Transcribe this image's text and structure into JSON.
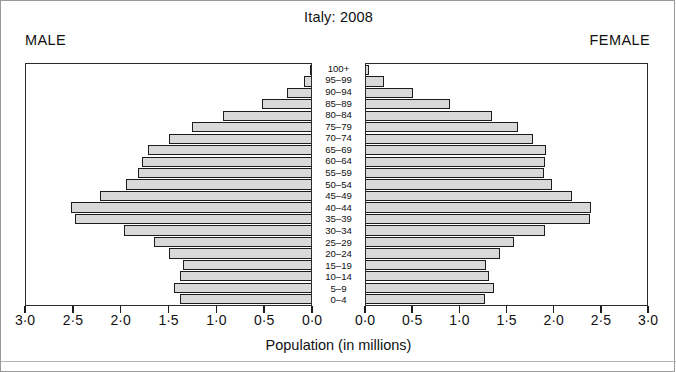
{
  "figure": {
    "title": "Italy:  2008",
    "male_label": "MALE",
    "female_label": "FEMALE",
    "xlabel": "Population (in millions)",
    "bar_fill": "#d9d9d9",
    "bar_stroke": "#1c1c1c",
    "frame_color": "#2b2b2b"
  },
  "axis": {
    "left_ticklabels": [
      "3·0",
      "2·5",
      "2·0",
      "1·5",
      "1·0",
      "0·5",
      "0·0"
    ],
    "right_ticklabels": [
      "0·0",
      "0·5",
      "1·0",
      "1·5",
      "2·0",
      "2·5",
      "3·0"
    ],
    "tick_values": [
      0.0,
      0.5,
      1.0,
      1.5,
      2.0,
      2.5,
      3.0
    ],
    "max": 3.0
  },
  "chart_data": {
    "type": "bar",
    "title": "Italy:  2008",
    "subtitle": "",
    "xlabel": "Population (in millions)",
    "ylabel": "",
    "xlim": [
      0,
      3.0
    ],
    "grid": false,
    "legend": [
      "MALE",
      "FEMALE"
    ],
    "legend_position": "top-left and top-right outside plot",
    "orientation": "population-pyramid",
    "categories": [
      "0–4",
      "5–9",
      "10–14",
      "15–19",
      "20–24",
      "25–29",
      "30–34",
      "35–39",
      "40–44",
      "45–49",
      "50–54",
      "55–59",
      "60–64",
      "65–69",
      "70–74",
      "75–79",
      "80–84",
      "85–89",
      "90–94",
      "95–99",
      "100+"
    ],
    "series": [
      {
        "name": "MALE",
        "side": "left",
        "values": [
          1.38,
          1.44,
          1.38,
          1.35,
          1.5,
          1.65,
          1.97,
          2.48,
          2.53,
          2.22,
          1.95,
          1.82,
          1.78,
          1.72,
          1.5,
          1.25,
          0.93,
          0.52,
          0.25,
          0.07,
          0.01
        ]
      },
      {
        "name": "FEMALE",
        "side": "right",
        "values": [
          1.27,
          1.37,
          1.31,
          1.28,
          1.43,
          1.58,
          1.91,
          2.39,
          2.4,
          2.2,
          1.99,
          1.9,
          1.91,
          1.92,
          1.78,
          1.62,
          1.35,
          0.9,
          0.5,
          0.19,
          0.03
        ]
      }
    ]
  }
}
